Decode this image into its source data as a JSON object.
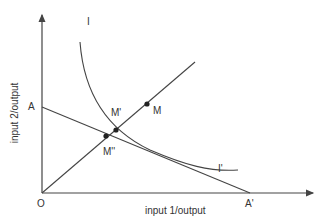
{
  "diagram": {
    "type": "isoquant",
    "colors": {
      "line": "#444444",
      "text": "#333333",
      "background": "#ffffff"
    },
    "axes": {
      "xlabel": "input 1/output",
      "ylabel": "input 2/output",
      "origin_label": "O"
    },
    "labels": {
      "isoquant_top": "I",
      "isoquant_bottom": "I'",
      "budget_y_intercept": "A",
      "budget_x_intercept": "A'",
      "point_m": "M",
      "point_m_prime": "M'",
      "point_m_double_prime": "M''"
    }
  }
}
